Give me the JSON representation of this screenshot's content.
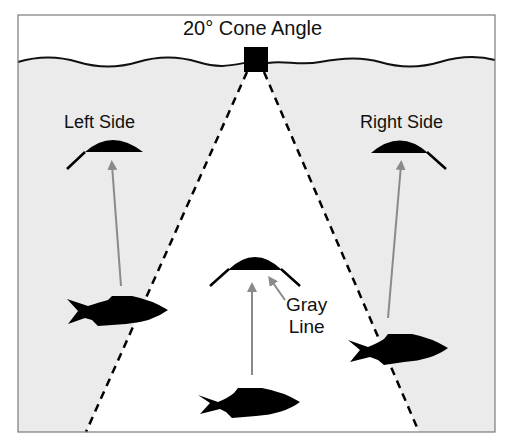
{
  "title": "20° Cone Angle",
  "labels": {
    "left_side": "Left Side",
    "right_side": "Right Side",
    "gray_line_1": "Gray",
    "gray_line_2": "Line"
  },
  "colors": {
    "water": "#ebebeb",
    "cone": "#ffffff",
    "ink": "#000000",
    "arrow": "#8a8a8a",
    "frame": "#7a7a7a"
  },
  "cone_angle_deg": 20
}
